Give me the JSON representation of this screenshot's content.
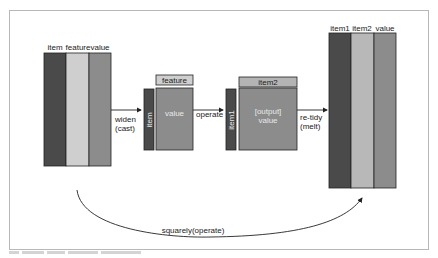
{
  "diagram": {
    "input_table": {
      "columns": [
        "item",
        "feature",
        "value"
      ]
    },
    "cast_step": {
      "arrow_label_line1": "widen",
      "arrow_label_line2": "(cast)",
      "row_strip_label": "item",
      "header_label": "feature",
      "body_label": "value"
    },
    "operate_step": {
      "arrow_label": "operate",
      "row_strip_label": "item1",
      "header_label": "item2",
      "body_label_line1": "[output]",
      "body_label_line2": "value"
    },
    "melt_step": {
      "arrow_label_line1": "re-tidy",
      "arrow_label_line2": "(melt)"
    },
    "output_table": {
      "columns": [
        "item1",
        "item2",
        "value"
      ]
    },
    "shortcut": {
      "label": "squarely(operate)"
    },
    "colors": {
      "dark": "#4a4a4a",
      "light": "#cfcfcf",
      "mid": "#8c8c8c",
      "header": "#b4b4b4",
      "stroke": "#222222"
    }
  }
}
